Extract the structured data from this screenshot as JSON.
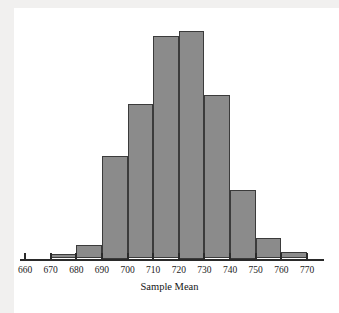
{
  "figure": {
    "background_color": "#f1f0ef",
    "canvas_color": "#ffffff",
    "bar_fill": "#8b8b8b",
    "bar_edge": "#3b3b3b",
    "axis_color": "#2a2a2a"
  },
  "chart_data": {
    "type": "bar",
    "title": "",
    "xlabel": "Sample Mean",
    "ylabel": "",
    "grid": false,
    "legend": null,
    "axis_ticks": [
      660,
      670,
      680,
      690,
      700,
      710,
      720,
      730,
      740,
      750,
      760,
      770
    ],
    "tick_labels": [
      "660",
      "670",
      "680",
      "690",
      "700",
      "710",
      "720",
      "730",
      "740",
      "750",
      "760",
      "770"
    ],
    "xlim": [
      655,
      775
    ],
    "ylim": [
      0,
      100
    ],
    "bin_width": 10,
    "bin_edges": [
      660,
      670,
      680,
      690,
      700,
      710,
      720,
      730,
      740,
      750,
      760,
      770
    ],
    "categories": [
      "660-670",
      "670-680",
      "680-690",
      "690-700",
      "700-710",
      "710-720",
      "720-730",
      "730-740",
      "740-750",
      "750-760",
      "760-770"
    ],
    "values": [
      0,
      2,
      6,
      45,
      68,
      98,
      100,
      72,
      30,
      9,
      3
    ],
    "bars": [
      {
        "bin": "660-670",
        "x0": 660,
        "x1": 670,
        "value": 0
      },
      {
        "bin": "670-680",
        "x0": 670,
        "x1": 680,
        "value": 2
      },
      {
        "bin": "680-690",
        "x0": 680,
        "x1": 690,
        "value": 6
      },
      {
        "bin": "690-700",
        "x0": 690,
        "x1": 700,
        "value": 45
      },
      {
        "bin": "700-710",
        "x0": 700,
        "x1": 710,
        "value": 68
      },
      {
        "bin": "710-720",
        "x0": 710,
        "x1": 720,
        "value": 98
      },
      {
        "bin": "720-730",
        "x0": 720,
        "x1": 730,
        "value": 100
      },
      {
        "bin": "730-740",
        "x0": 730,
        "x1": 740,
        "value": 72
      },
      {
        "bin": "740-750",
        "x0": 740,
        "x1": 750,
        "value": 30
      },
      {
        "bin": "750-760",
        "x0": 750,
        "x1": 760,
        "value": 9
      },
      {
        "bin": "760-770",
        "x0": 760,
        "x1": 770,
        "value": 3
      }
    ]
  }
}
